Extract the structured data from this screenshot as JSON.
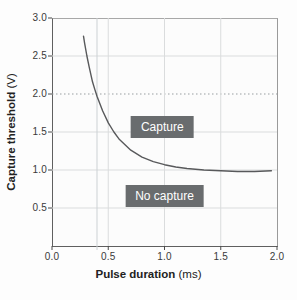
{
  "figure": {
    "x_axis_title_bold": "Pulse duration",
    "x_axis_title_unit": " (ms)",
    "y_axis_title_bold": "Capture threshold",
    "y_axis_title_unit": " (V)",
    "colors": {
      "region_box_bg": "#696c6e",
      "region_box_text": "#ffffff",
      "curve": "#58595b",
      "gridline": "#dadcdd",
      "dotted_gridline": "#989ea1",
      "extra_line": "#ccd1d4",
      "axis_tick": "#4a4a4a"
    }
  },
  "chart_data": {
    "type": "line",
    "title": "",
    "xlabel": "Pulse duration (ms)",
    "ylabel": "Capture threshold (V)",
    "xlim": [
      0.0,
      2.0
    ],
    "ylim": [
      0.0,
      3.0
    ],
    "x_ticks": [
      0.0,
      0.5,
      1.0,
      1.5,
      2.0
    ],
    "x_tick_labels": [
      "0.0",
      "0.5",
      "1.0",
      "1.5",
      "2.0"
    ],
    "y_ticks": [
      0.5,
      1.0,
      1.5,
      2.0,
      2.5,
      3.0
    ],
    "y_tick_labels": [
      "0.5",
      "1.0",
      "1.5",
      "2.0",
      "2.5",
      "3.0"
    ],
    "grid": true,
    "dotted_gridline_y": 2.0,
    "extra_vertical_line_x": 0.4,
    "series": [
      {
        "name": "strength-duration curve",
        "points": [
          [
            0.28,
            2.76
          ],
          [
            0.29,
            2.67
          ],
          [
            0.31,
            2.5
          ],
          [
            0.33,
            2.36
          ],
          [
            0.36,
            2.16
          ],
          [
            0.38,
            2.06
          ],
          [
            0.4,
            1.97
          ],
          [
            0.45,
            1.78
          ],
          [
            0.5,
            1.62
          ],
          [
            0.55,
            1.5
          ],
          [
            0.6,
            1.4
          ],
          [
            0.7,
            1.26
          ],
          [
            0.8,
            1.17
          ],
          [
            0.9,
            1.11
          ],
          [
            1.0,
            1.07
          ],
          [
            1.1,
            1.04
          ],
          [
            1.2,
            1.02
          ],
          [
            1.35,
            1.0
          ],
          [
            1.5,
            0.99
          ],
          [
            1.65,
            0.98
          ],
          [
            1.8,
            0.98
          ],
          [
            1.95,
            0.99
          ]
        ]
      }
    ],
    "annotations": [
      {
        "text": "Capture",
        "x": 0.98,
        "y": 1.56
      },
      {
        "text": "No capture",
        "x": 1.0,
        "y": 0.66
      }
    ]
  }
}
